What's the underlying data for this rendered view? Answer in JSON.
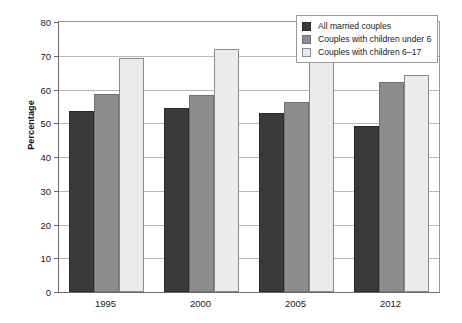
{
  "chart_data": {
    "type": "bar",
    "title": "",
    "xlabel": "",
    "ylabel": "Percentage",
    "ylim": [
      0,
      80
    ],
    "yticks": [
      0,
      10,
      20,
      30,
      40,
      50,
      60,
      70,
      80
    ],
    "ytick_labels": [
      "0",
      "10",
      "20",
      "30",
      "40",
      "50",
      "60",
      "70",
      "80"
    ],
    "grid": true,
    "legend_position": "top-right",
    "categories": [
      "1995",
      "2000",
      "2005",
      "2012"
    ],
    "series": [
      {
        "name": "All married couples",
        "color": "#3a3a3a",
        "values": [
          53.5,
          54.6,
          53.0,
          49.3
        ]
      },
      {
        "name": "Couples with children under 6",
        "color": "#8d8d8d",
        "values": [
          58.8,
          58.5,
          56.3,
          62.3
        ]
      },
      {
        "name": "Couples with children 6–17",
        "color": "#ebebeb",
        "values": [
          69.3,
          71.9,
          68.7,
          64.4
        ]
      }
    ]
  }
}
